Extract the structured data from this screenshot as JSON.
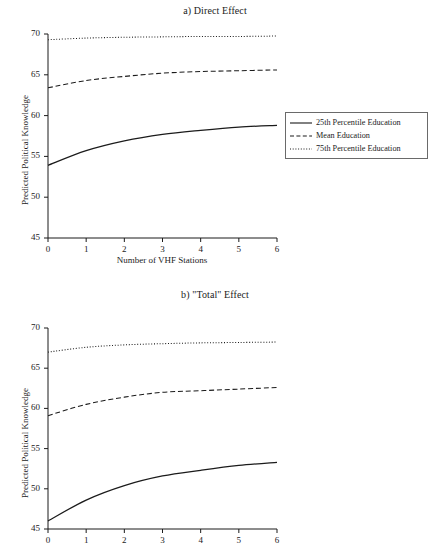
{
  "figure": {
    "panels": [
      {
        "id": "a",
        "title": "a) Direct Effect",
        "ylabel": "Predicted Political Knowledge",
        "xlabel": "Number of VHF Stations"
      },
      {
        "id": "b",
        "title": "b) \"Total\" Effect",
        "ylabel": "Predicted Political Knowledge",
        "xlabel": ""
      }
    ]
  },
  "legend": {
    "entries": [
      {
        "label": "25th Percentile Education",
        "style": "solid"
      },
      {
        "label": "Mean Education",
        "style": "dashed"
      },
      {
        "label": "75th Percentile Education",
        "style": "dotted"
      }
    ]
  },
  "chart_data": [
    {
      "type": "line",
      "panel": "a",
      "title": "a) Direct Effect",
      "xlabel": "Number of VHF Stations",
      "ylabel": "Predicted Political Knowledge",
      "x": [
        0,
        1,
        2,
        3,
        4,
        5,
        6
      ],
      "xlim": [
        0,
        6
      ],
      "ylim": [
        45,
        70
      ],
      "xticks": [
        0,
        1,
        2,
        3,
        4,
        5,
        6
      ],
      "yticks": [
        45,
        50,
        55,
        60,
        65,
        70
      ],
      "grid": false,
      "legend_position": "right",
      "series": [
        {
          "name": "25th Percentile Education",
          "style": "solid",
          "values": [
            53.9,
            55.7,
            56.9,
            57.7,
            58.2,
            58.6,
            58.8
          ]
        },
        {
          "name": "Mean Education",
          "style": "dashed",
          "values": [
            63.4,
            64.3,
            64.8,
            65.2,
            65.4,
            65.5,
            65.6
          ]
        },
        {
          "name": "75th Percentile Education",
          "style": "dotted",
          "values": [
            69.3,
            69.5,
            69.6,
            69.65,
            69.7,
            69.7,
            69.75
          ]
        }
      ]
    },
    {
      "type": "line",
      "panel": "b",
      "title": "b) \"Total\" Effect",
      "xlabel": "",
      "ylabel": "Predicted Political Knowledge",
      "x": [
        0,
        1,
        2,
        3,
        4,
        5,
        6
      ],
      "xlim": [
        0,
        6
      ],
      "ylim": [
        45,
        70
      ],
      "xticks": [
        0,
        1,
        2,
        3,
        4,
        5,
        6
      ],
      "yticks": [
        45,
        50,
        55,
        60,
        65,
        70
      ],
      "grid": false,
      "legend_position": "right",
      "series": [
        {
          "name": "25th Percentile Education",
          "style": "solid",
          "values": [
            46.0,
            48.6,
            50.4,
            51.6,
            52.3,
            52.9,
            53.3
          ]
        },
        {
          "name": "Mean Education",
          "style": "dashed",
          "values": [
            59.1,
            60.5,
            61.4,
            62.0,
            62.2,
            62.4,
            62.6
          ]
        },
        {
          "name": "75th Percentile Education",
          "style": "dotted",
          "values": [
            67.0,
            67.6,
            67.9,
            68.05,
            68.15,
            68.2,
            68.25
          ]
        }
      ]
    }
  ]
}
